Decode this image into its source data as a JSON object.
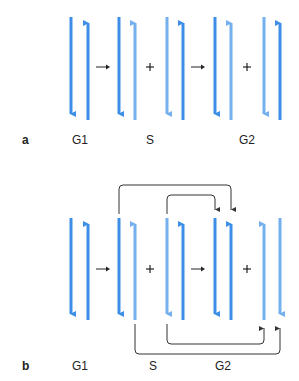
{
  "colors": {
    "dark_strand": "#3d8ee6",
    "light_strand": "#74afee",
    "connector": "#333333",
    "text": "#222222"
  },
  "panels": [
    {
      "id": "a",
      "letter": "a",
      "labels": [
        {
          "text": "G1",
          "x": 80
        },
        {
          "text": "S",
          "x": 150
        },
        {
          "text": "G2",
          "x": 247
        }
      ],
      "operators": [
        {
          "symbol": "→",
          "x": 102
        },
        {
          "symbol": "+",
          "x": 150
        },
        {
          "symbol": "→",
          "x": 199
        },
        {
          "symbol": "+",
          "x": 247
        }
      ]
    },
    {
      "id": "b",
      "letter": "b",
      "labels": [
        {
          "text": "G1",
          "x": 80
        },
        {
          "text": "S",
          "x": 150
        },
        {
          "text": "G2",
          "x": 223
        }
      ],
      "operators": [
        {
          "symbol": "→",
          "x": 102
        },
        {
          "symbol": "+",
          "x": 150
        },
        {
          "symbol": "→",
          "x": 199
        },
        {
          "symbol": "+",
          "x": 247
        }
      ]
    }
  ]
}
